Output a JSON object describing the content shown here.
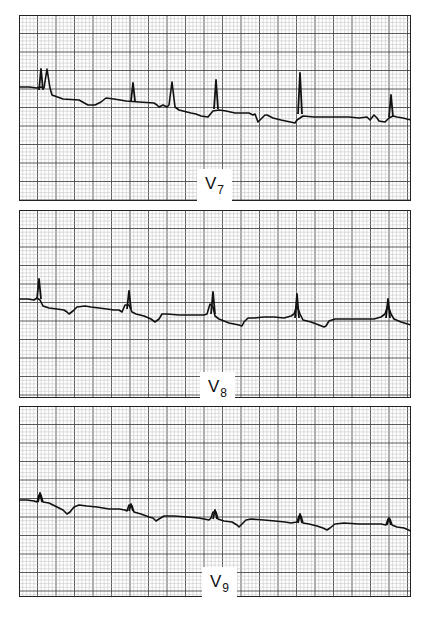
{
  "figure": {
    "grid": {
      "minor_color": "#bdbdbd",
      "major_color": "#4a4a4a",
      "border_color": "#222222",
      "trace_color": "#111111",
      "minor_spacing_px": 3.7,
      "major_every": 5
    },
    "strips": [
      {
        "lead": "V",
        "lead_sub": "7",
        "top": 15,
        "height": 186,
        "label_left": 197,
        "label_top": 169,
        "trace": "0,72 10,72 18,73 22,72 25,73 28,54 31,73 33,80 44,84 60,85 69,90 76,90 82,87 87,83 95,84 107,86 120,87 135,88 138,90 140,92 144,90 148,92 150,90 153,67 156,92 160,95 168,97 172,98 177,99 182,101 189,102 194,96 200,95 207,96 216,98 230,98 234,100 236,99 239,107 246,100 248,100 250,101 254,103 262,105 276,108 278,105 284,101 295,102 310,102 330,102 340,103 348,102 351,105 355,100 358,103 360,106 366,107 370,103 374,101 378,102 384,103 392,105",
        "peaks": [
          {
            "x": 22,
            "top": 54,
            "base": 75
          },
          {
            "x": 114,
            "top": 68,
            "base": 86
          },
          {
            "x": 197,
            "top": 65,
            "base": 94
          },
          {
            "x": 281,
            "top": 58,
            "base": 99
          },
          {
            "x": 372,
            "top": 80,
            "base": 102
          }
        ]
      },
      {
        "lead": "V",
        "lead_sub": "8",
        "top": 210,
        "height": 188,
        "label_left": 200,
        "label_top": 372,
        "trace": "0,89 9,89 15,90 18,88 21,90 24,96 30,98 38,99 45,100 48,102 50,104 54,101 58,97 66,96 72,97 80,98 88,99 95,100 100,100 103,102 106,95 110,95 113,102 117,104 125,106 132,109 136,112 140,109 143,104 148,104 160,105 170,105 181,105 185,105 188,104 191,94 194,97 196,106 200,109 210,113 215,114 220,115 223,116 225,112 229,108 235,108 245,107 255,107 265,108 272,106 275,104 278,96 281,104 284,110 292,112 300,115 305,117 307,116 310,111 316,109 325,109 340,109 355,109 362,107 366,104 369,95 372,104 375,109 382,112 392,115",
        "peaks": [
          {
            "x": 20,
            "top": 69,
            "base": 89
          },
          {
            "x": 110,
            "top": 81,
            "base": 99
          },
          {
            "x": 194,
            "top": 82,
            "base": 104
          },
          {
            "x": 278,
            "top": 84,
            "base": 108
          },
          {
            "x": 369,
            "top": 89,
            "base": 108
          }
        ]
      },
      {
        "lead": "V",
        "lead_sub": "9",
        "top": 406,
        "height": 191,
        "label_left": 202,
        "label_top": 567,
        "trace": "0,94 8,94 15,95 18,96 20,89 22,89 24,96 30,97 38,101 44,104 48,108 51,106 55,101 60,99 68,100 78,101 90,103 100,103 106,104 108,105 110,99 113,100 115,106 122,108 130,111 134,112 137,115 140,113 145,110 155,110 168,111 180,112 190,114 192,112 194,106 197,106 199,113 205,115 213,116 218,119 220,121 223,118 227,114 232,113 245,114 256,115 266,116 272,117 278,116 280,110 282,110 284,117 290,118 298,120 304,122 308,124 311,122 316,118 325,117 340,118 355,118 362,118 367,119 369,113 371,113 373,119 378,121 385,122 392,125",
        "peaks": [
          {
            "x": 21,
            "top": 87,
            "base": 96
          },
          {
            "x": 112,
            "top": 98,
            "base": 105
          },
          {
            "x": 196,
            "top": 104,
            "base": 113
          },
          {
            "x": 281,
            "top": 108,
            "base": 117
          },
          {
            "x": 370,
            "top": 112,
            "base": 119
          }
        ]
      }
    ]
  }
}
